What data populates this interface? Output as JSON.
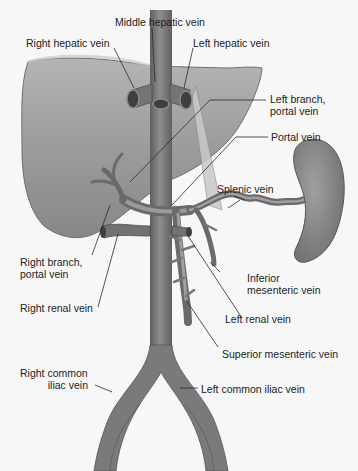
{
  "diagram": {
    "colors": {
      "background": "#f7f7f7",
      "liver": "#9a9a9a",
      "liver_edge": "#6f6f6f",
      "vessel": "#7d7d7d",
      "vessel_dark": "#4d4d4d",
      "spleen": "#8c8c8c",
      "leader_line": "#2a2a2a",
      "text": "#1c1c1c"
    },
    "structures": [
      "Liver",
      "Inferior vena cava",
      "Spleen",
      "Portal vein system"
    ],
    "labels": {
      "middle_hepatic": "Middle hepatic vein",
      "right_hepatic": "Right hepatic vein",
      "left_hepatic": "Left hepatic vein",
      "left_branch_1": "Left branch,",
      "left_branch_2": "portal vein",
      "portal": "Portal vein",
      "splenic": "Splenic vein",
      "right_branch_1": "Right branch,",
      "right_branch_2": "portal vein",
      "inferior_mes_1": "Inferior",
      "inferior_mes_2": "mesenteric vein",
      "right_renal": "Right renal vein",
      "left_renal": "Left renal vein",
      "superior_mes": "Superior mesenteric vein",
      "right_iliac_1": "Right common",
      "right_iliac_2": "iliac vein",
      "left_iliac": "Left common iliac vein"
    }
  }
}
